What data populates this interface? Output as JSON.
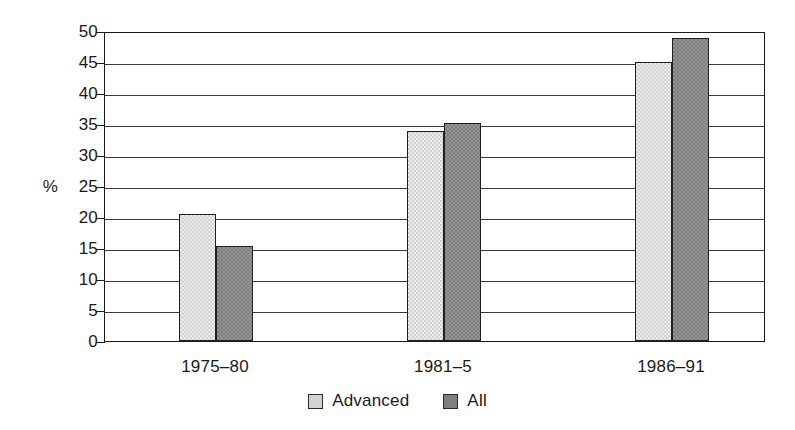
{
  "chart_data": {
    "type": "bar",
    "title": "",
    "subtitle": "",
    "xlabel": "",
    "ylabel": "%",
    "categories": [
      "1975–80",
      "1981–5",
      "1986–91"
    ],
    "series": [
      {
        "name": "Advanced",
        "values": [
          20.5,
          33.8,
          45.0
        ],
        "color": "#d2d2d2"
      },
      {
        "name": "All",
        "values": [
          15.3,
          35.1,
          48.8
        ],
        "color": "#7f7f7f"
      }
    ],
    "ylim": [
      0,
      50
    ],
    "yticks": [
      0,
      5,
      10,
      15,
      20,
      25,
      30,
      35,
      40,
      45,
      50
    ],
    "ytick_labels": [
      "0",
      "5",
      "10",
      "15",
      "20",
      "25",
      "30",
      "35",
      "40",
      "45",
      "50"
    ],
    "grid": true,
    "grid_axis": "y",
    "legend": [
      "Advanced",
      "All"
    ],
    "legend_position": "bottom-center",
    "bar_gap": "grouped-adjacent",
    "frame": true
  },
  "axis": {
    "unit_label": "%"
  },
  "legend": {
    "entries": [
      {
        "label": "Advanced",
        "swatch": "light-gray-square"
      },
      {
        "label": "All",
        "swatch": "dark-gray-square"
      }
    ]
  }
}
